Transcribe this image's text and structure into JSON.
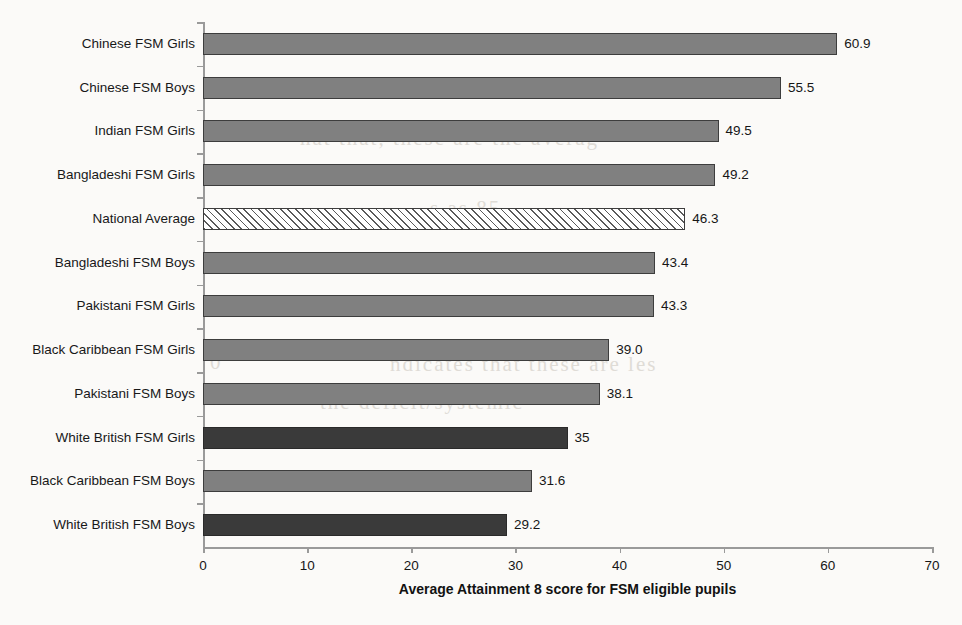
{
  "chart_data": {
    "type": "bar",
    "orientation": "horizontal",
    "title": "",
    "xlabel": "Average Attainment 8 score for FSM eligible pupils",
    "ylabel": "",
    "xlim": [
      0,
      70
    ],
    "xticks": [
      "0",
      "10",
      "20",
      "30",
      "40",
      "50",
      "60",
      "70"
    ],
    "grid": false,
    "legend": "none",
    "categories": [
      "Chinese FSM Girls",
      "Chinese FSM Boys",
      "Indian FSM Girls",
      "Bangladeshi FSM Girls",
      "National Average",
      "Bangladeshi FSM Boys",
      "Pakistani FSM Girls",
      "Black Caribbean FSM Girls",
      "Pakistani FSM Boys",
      "White British FSM Girls",
      "Black Caribbean FSM Boys",
      "White British FSM Boys"
    ],
    "values": [
      60.9,
      55.5,
      49.5,
      49.2,
      46.3,
      43.4,
      43.3,
      39.0,
      38.1,
      35,
      31.6,
      29.2
    ],
    "value_labels": [
      "60.9",
      "55.5",
      "49.5",
      "49.2",
      "46.3",
      "43.4",
      "43.3",
      "39.0",
      "38.1",
      "35",
      "31.6",
      "29.2"
    ],
    "bar_styles": [
      "gray",
      "gray",
      "gray",
      "gray",
      "hatch",
      "gray",
      "gray",
      "gray",
      "gray",
      "dark",
      "gray",
      "dark"
    ],
    "colors": {
      "gray": "#808080",
      "dark": "#3a3a3a",
      "hatch_fill": "#ffffff",
      "hatch_stroke": "#5a5a5a",
      "bar_outline": "#3d3d3d",
      "axis": "#9a9a9a",
      "text": "#161616",
      "background": "#fbfaf8"
    }
  },
  "background_showthrough": [
    {
      "text": "nat that, these are the averag",
      "x": 300,
      "y": 126
    },
    {
      "text": "1cy in the curriculum and th",
      "x": 352,
      "y": 160
    },
    {
      "text": "s as 85",
      "x": 430,
      "y": 196
    },
    {
      "text": "0",
      "x": 210,
      "y": 350
    },
    {
      "text": "ndicates that these are les",
      "x": 390,
      "y": 352
    },
    {
      "text": "the deficit/systemic",
      "x": 320,
      "y": 390
    },
    {
      "text": "students in educationa",
      "x": 300,
      "y": 428
    },
    {
      "text": "of",
      "x": 265,
      "y": 468
    }
  ]
}
